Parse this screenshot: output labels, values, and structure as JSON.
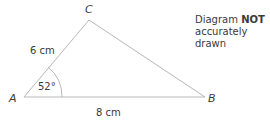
{
  "diagram": {
    "type": "triangle",
    "vertices": {
      "A": {
        "label": "A",
        "x": 24,
        "y": 97
      },
      "B": {
        "label": "B",
        "x": 205,
        "y": 97
      },
      "C": {
        "label": "C",
        "x": 89,
        "y": 20
      }
    },
    "side_labels": {
      "AC": "6 cm",
      "AB": "8 cm"
    },
    "angle_labels": {
      "A": "52°"
    },
    "note": {
      "prefix": "Diagram",
      "emphasis": "NOT",
      "suffix": "accurately drawn"
    },
    "colors": {
      "line": "#b8b8b8",
      "text": "#3a3a3a"
    }
  }
}
